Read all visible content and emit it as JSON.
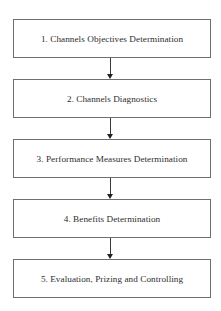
{
  "diagram": {
    "type": "vertical-flowchart",
    "colors": {
      "box_border": "#6f6f6f",
      "text": "#2e2e2e",
      "arrow": "#3a3a3a",
      "background": "#ffffff"
    },
    "steps": [
      {
        "label": "1. Channels Objectives Determination"
      },
      {
        "label": "2. Channels Diagnostics"
      },
      {
        "label": "3. Performance Measures Determination"
      },
      {
        "label": "4. Benefits Determination"
      },
      {
        "label": "5. Evaluation, Prizing and Controlling"
      }
    ],
    "connections": [
      {
        "from": 1,
        "to": 2
      },
      {
        "from": 2,
        "to": 3
      },
      {
        "from": 3,
        "to": 4
      },
      {
        "from": 4,
        "to": 5
      }
    ]
  }
}
